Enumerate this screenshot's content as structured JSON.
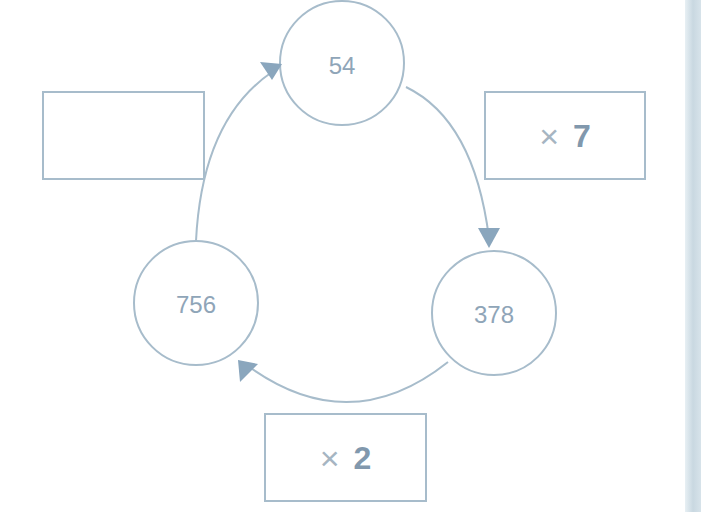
{
  "diagram": {
    "type": "cycle",
    "nodes": [
      {
        "id": "top",
        "label": "54"
      },
      {
        "id": "right",
        "label": "378"
      },
      {
        "id": "left",
        "label": "756"
      }
    ],
    "operations": [
      {
        "id": "top-right",
        "from": "54",
        "to": "378",
        "symbol": "×",
        "value": "7"
      },
      {
        "id": "bottom",
        "from": "378",
        "to": "756",
        "symbol": "×",
        "value": "2"
      },
      {
        "id": "top-left",
        "from": "756",
        "to": "54",
        "symbol": "",
        "value": ""
      }
    ],
    "colors": {
      "stroke": "#a7bccb",
      "arrowhead": "#8aa6bd",
      "text": "#8fa5b8",
      "operand_bold": "#8198ad"
    }
  }
}
